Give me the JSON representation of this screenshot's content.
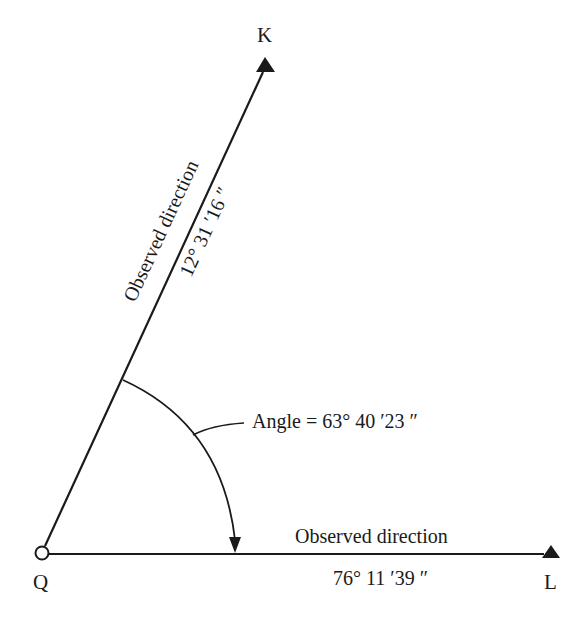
{
  "diagram": {
    "points": {
      "Q": {
        "label": "Q",
        "x": 42,
        "y": 553,
        "marker": "open-circle"
      },
      "K": {
        "label": "K",
        "x": 265,
        "y": 62,
        "marker": "filled-triangle"
      },
      "L": {
        "label": "L",
        "x": 551,
        "y": 553,
        "marker": "filled-triangle"
      }
    },
    "line_QK": {
      "caption": "Observed direction",
      "value": "12° 31 ′16 ″"
    },
    "line_QL": {
      "caption": "Observed direction",
      "value": "76° 11 ′39 ″"
    },
    "angle": {
      "label": "Angle = 63° 40 ′23 ″"
    },
    "colors": {
      "ink": "#1a1a1a",
      "background": "#ffffff"
    }
  }
}
